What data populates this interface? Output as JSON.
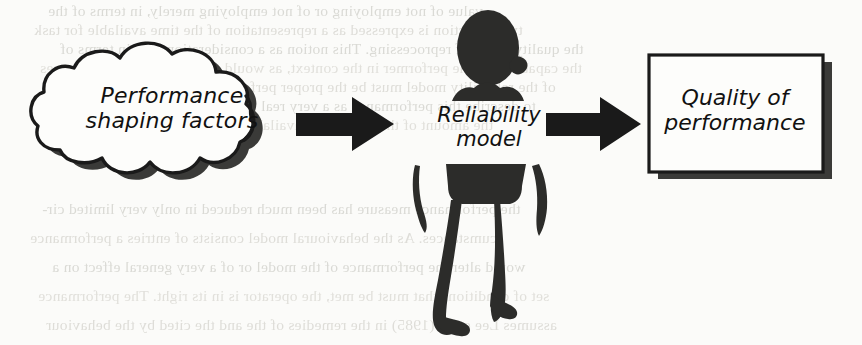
{
  "document": {
    "type": "scanned-book-page-figure",
    "background_color": "#fbfbf9",
    "ink_color": "#1a1a1a",
    "bleed_through_color": "#dcdbd6"
  },
  "diagram": {
    "orientation": "left-to-right",
    "nodes": [
      {
        "id": "performance-shaping-factors",
        "shape": "cloud",
        "label_line1": "Performance",
        "label_line2": "shaping factors",
        "has_drop_shadow": true
      },
      {
        "id": "reliability-model",
        "shape": "human-figure-silhouette",
        "label_line1": "Reliability",
        "label_line2": "model",
        "has_drop_shadow": false
      },
      {
        "id": "quality-of-performance",
        "shape": "rectangle",
        "label_line1": "Quality of",
        "label_line2": "performance",
        "has_drop_shadow": true
      }
    ],
    "arrows": [
      {
        "id": "arrow-1",
        "from": "performance-shaping-factors",
        "to": "reliability-model",
        "style": "solid-block-arrow",
        "direction": "right"
      },
      {
        "id": "arrow-2",
        "from": "reliability-model",
        "to": "quality-of-performance",
        "style": "solid-block-arrow",
        "direction": "right"
      }
    ]
  },
  "background_text": {
    "note": "mirrored bleed-through from reverse of page, illegible",
    "top_lines": [
      "value of not employing or of not employing merely, in terms of the",
      "type of action is expressed as a representation of the time available for task",
      "the quality status of reprocessing. This notion as a consideration, and in terms of",
      "the capability of the performer in the context, as would the probability of responses",
      "of the reliability model must be the proper performer and the cost of a system",
      "to describe this performance as a very real point in time, as a consequence of",
      "the amount of the processing available time"
    ],
    "bottom_lines": [
      "the performance measure has been much reduced in only very limited cir-",
      "cumstances. As the behavioural model consists of entries a performance",
      "would alter the performance of the model or of a very general effect on a",
      "set of conditions that must be met, the operator is in its right. The performance",
      "assumes Lee et al. (1985) in the remedies of the and the cited by the behaviour"
    ]
  }
}
